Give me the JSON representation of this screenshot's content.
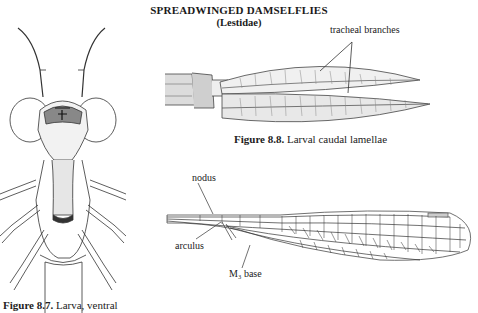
{
  "header": {
    "title": "SPREADWINGED DAMSELFLIES",
    "subtitle": "(Lestidae)"
  },
  "figures": [
    {
      "id": "8.7",
      "caption_prefix": "Figure 8.7.",
      "caption_text": "Larva, ventral",
      "subject": "larva-ventral-view",
      "labels": []
    },
    {
      "id": "8.8",
      "caption_prefix": "Figure 8.8.",
      "caption_text": "Larval caudal lamellae",
      "subject": "caudal-lamellae",
      "labels": [
        "tracheal branches"
      ]
    },
    {
      "id": "wing",
      "subject": "wing-venation",
      "labels": [
        "nodus",
        "arculus",
        "M₃ base"
      ]
    }
  ],
  "colors": {
    "ink": "#222222",
    "shade": "#777777",
    "background": "#ffffff"
  }
}
